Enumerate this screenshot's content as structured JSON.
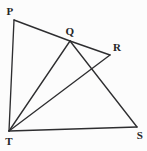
{
  "figure": {
    "background_color": "#fcfcfc",
    "stroke_color": "#2e2e30",
    "label_color": "#252527",
    "width": 147,
    "height": 151,
    "points": [
      {
        "name": "P",
        "label": "P",
        "x": 14,
        "y": 20,
        "label_x": 10,
        "label_y": 11
      },
      {
        "name": "Q",
        "label": "Q",
        "x": 70,
        "y": 41,
        "label_x": 70,
        "label_y": 31
      },
      {
        "name": "R",
        "label": "R",
        "x": 110,
        "y": 55,
        "label_x": 117,
        "label_y": 47
      },
      {
        "name": "S",
        "label": "S",
        "x": 137,
        "y": 127,
        "label_x": 140,
        "label_y": 135
      },
      {
        "name": "T",
        "label": "T",
        "x": 9,
        "y": 131,
        "label_x": 9,
        "label_y": 141
      }
    ],
    "segments": [
      {
        "name": "segment-P-Q",
        "from": "P",
        "to": "Q"
      },
      {
        "name": "segment-Q-R",
        "from": "Q",
        "to": "R"
      },
      {
        "name": "segment-P-T",
        "from": "P",
        "to": "T"
      },
      {
        "name": "segment-T-Q",
        "from": "T",
        "to": "Q"
      },
      {
        "name": "segment-T-R",
        "from": "T",
        "to": "R"
      },
      {
        "name": "segment-T-S",
        "from": "T",
        "to": "S"
      },
      {
        "name": "segment-Q-S",
        "from": "Q",
        "to": "S"
      }
    ]
  }
}
